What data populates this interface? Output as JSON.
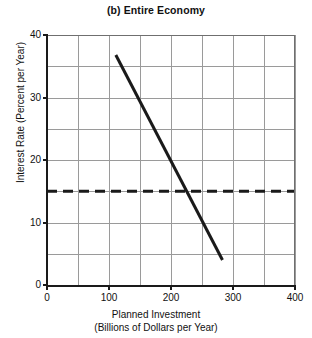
{
  "chart_data": {
    "type": "line",
    "title": "(b) Entire Economy",
    "xlabel_line1": "Planned Investment",
    "xlabel_line2": "(Billions of Dollars per Year)",
    "ylabel": "Interest Rate (Percent per Year)",
    "xlim": [
      0,
      400
    ],
    "ylim": [
      0,
      40
    ],
    "xticks": [
      0,
      100,
      200,
      300,
      400
    ],
    "yticks": [
      0,
      10,
      20,
      30,
      40
    ],
    "xtick_labels": [
      "0",
      "100",
      "200",
      "300",
      "400"
    ],
    "ytick_labels": [
      "0",
      "10",
      "20",
      "30",
      "40"
    ],
    "x_minor_step": 50,
    "y_minor_step": 5,
    "grid": true,
    "legend": "none",
    "series": [
      {
        "name": "Investment Demand",
        "style": "solid",
        "color": "#1a1a1a",
        "width": 3,
        "points": [
          {
            "x": 111,
            "y": 36.8
          },
          {
            "x": 283,
            "y": 4.0
          }
        ]
      },
      {
        "name": "Interest Rate Level",
        "style": "dashed",
        "color": "#1a1a1a",
        "width": 3,
        "points": [
          {
            "x": 0,
            "y": 15
          },
          {
            "x": 400,
            "y": 15
          }
        ]
      }
    ]
  }
}
